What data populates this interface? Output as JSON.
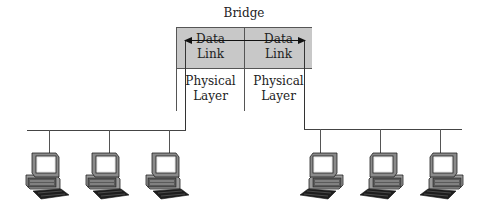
{
  "diagram": {
    "title": "Bridge",
    "bridge": {
      "left": {
        "upper_line1": "Data",
        "upper_line2": "Link",
        "lower_line1": "Physical",
        "lower_line2": "Layer"
      },
      "right": {
        "upper_line1": "Data",
        "upper_line2": "Link",
        "lower_line1": "Physical",
        "lower_line2": "Layer"
      },
      "upper_fill": "#c8c8c8"
    },
    "segments": [
      {
        "name": "left-lan",
        "computers": 3
      },
      {
        "name": "right-lan",
        "computers": 3
      }
    ],
    "connection": "bidirectional arrow between Data Link layers"
  }
}
